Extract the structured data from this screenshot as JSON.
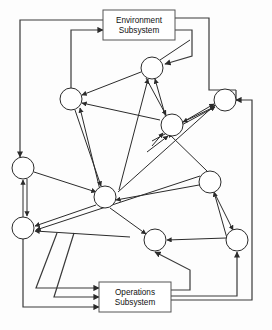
{
  "diagram": {
    "canvas": {
      "width": 272,
      "height": 330,
      "background": "#fdfdfd"
    },
    "style": {
      "stroke_color": "#2b2b2b",
      "box_stroke_color": "#555555",
      "node_fill": "#ffffff",
      "box_fill": "#ffffff"
    },
    "boxes": [
      {
        "id": "environment-subsystem",
        "name": "environment-subsystem-box",
        "line1": "Environment",
        "line2": "Subsystem",
        "x": 103,
        "y": 10,
        "width": 72,
        "height": 30
      },
      {
        "id": "operations-subsystem",
        "name": "operations-subsystem-box",
        "line1": "Operations",
        "line2": "Subsystem",
        "x": 99,
        "y": 282,
        "width": 72,
        "height": 30
      }
    ],
    "nodes": [
      {
        "id": "n1",
        "label": "",
        "cx": 152,
        "cy": 68,
        "r": 11
      },
      {
        "id": "n2",
        "label": "",
        "cx": 71,
        "cy": 99,
        "r": 11
      },
      {
        "id": "n3",
        "label": "",
        "cx": 225,
        "cy": 100,
        "r": 11
      },
      {
        "id": "n4",
        "label": "",
        "cx": 172,
        "cy": 125,
        "r": 11
      },
      {
        "id": "n5",
        "label": "",
        "cx": 23,
        "cy": 168,
        "r": 11
      },
      {
        "id": "n6",
        "label": "",
        "cx": 210,
        "cy": 182,
        "r": 11
      },
      {
        "id": "n7",
        "label": "",
        "cx": 105,
        "cy": 197,
        "r": 11
      },
      {
        "id": "n8",
        "label": "",
        "cx": 23,
        "cy": 228,
        "r": 11
      },
      {
        "id": "n9",
        "label": "",
        "cx": 155,
        "cy": 240,
        "r": 11
      },
      {
        "id": "n10",
        "label": "",
        "cx": 237,
        "cy": 240,
        "r": 11
      }
    ],
    "edge_count": 32
  }
}
